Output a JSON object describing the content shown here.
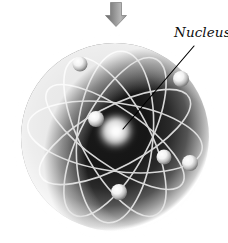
{
  "figure": {
    "background_color": "#ffffff"
  },
  "labels": {
    "nucleus": "Nucleus"
  },
  "annotations": {
    "leader_line": {
      "name": "nucleus-leader-line",
      "from": [
        194,
        46
      ],
      "to": [
        123,
        129
      ],
      "color": "#000000",
      "width": 1.1
    },
    "pointer_arrow": {
      "name": "down-arrow",
      "direction": "down",
      "x": 116,
      "y_top": 2,
      "y_bottom": 27,
      "color_light": "#c8c8c8",
      "color_dark": "#6e6e6e"
    }
  },
  "atom": {
    "center": [
      115,
      137
    ],
    "radius": 95,
    "sphere_dark_color": "#151515",
    "sphere_glow_color": "#d8d8d8",
    "orbit_color": "#e8e8e8",
    "orbit_count": 6,
    "nucleus": {
      "name": "nucleus",
      "cx": 117,
      "cy": 133,
      "r": 13,
      "color": "#ffffff"
    },
    "orbits": [
      {
        "rx": 88,
        "ry": 34,
        "rotation": 8
      },
      {
        "rx": 88,
        "ry": 34,
        "rotation": 62
      },
      {
        "rx": 88,
        "ry": 34,
        "rotation": 118
      },
      {
        "rx": 84,
        "ry": 30,
        "rotation": 152
      },
      {
        "rx": 86,
        "ry": 38,
        "rotation": 95
      },
      {
        "rx": 82,
        "ry": 28,
        "rotation": 35
      }
    ],
    "electrons": [
      {
        "name": "electron-top-left",
        "cx": 80,
        "cy": 64,
        "r": 7.5
      },
      {
        "name": "electron-right-upper",
        "cx": 181,
        "cy": 79,
        "r": 8.0
      },
      {
        "name": "electron-inner-left",
        "cx": 96,
        "cy": 119,
        "r": 8.0
      },
      {
        "name": "electron-right-mid",
        "cx": 164,
        "cy": 157,
        "r": 7.5
      },
      {
        "name": "electron-right-lower",
        "cx": 190,
        "cy": 163,
        "r": 8.0
      },
      {
        "name": "electron-bottom",
        "cx": 119,
        "cy": 192,
        "r": 8.0
      }
    ]
  }
}
